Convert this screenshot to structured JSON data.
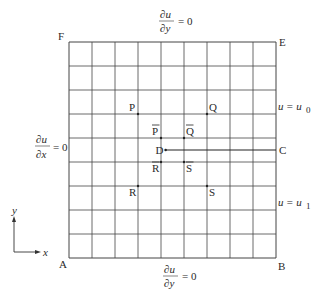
{
  "diagram": {
    "grid": {
      "columns": 9,
      "rows": 9
    },
    "corners": {
      "top_left": "F",
      "top_right": "E",
      "bottom_left": "A",
      "bottom_right": "B"
    },
    "boundary_labels": {
      "top": {
        "num": "∂u",
        "den": "∂y",
        "rhs": "= 0"
      },
      "bottom": {
        "num": "∂u",
        "den": "∂y",
        "rhs": "= 0"
      },
      "left": {
        "num": "∂u",
        "den": "∂x",
        "rhs": "= 0"
      },
      "right_upper": {
        "lhs": "u",
        "rhs": "= u",
        "sub": "0"
      },
      "right_lower": {
        "lhs": "u",
        "rhs": "= u",
        "sub": "1"
      }
    },
    "points": [
      {
        "id": "P",
        "label": "P",
        "bar": false,
        "col": 3,
        "row": 3
      },
      {
        "id": "Q",
        "label": "Q",
        "bar": false,
        "col": 6,
        "row": 3
      },
      {
        "id": "P-bar",
        "label": "P",
        "bar": true,
        "col": 4,
        "row": 4
      },
      {
        "id": "Q-bar",
        "label": "Q",
        "bar": true,
        "col": 5,
        "row": 4
      },
      {
        "id": "R-bar",
        "label": "R",
        "bar": true,
        "col": 4,
        "row": 5
      },
      {
        "id": "S-bar",
        "label": "S",
        "bar": true,
        "col": 5,
        "row": 5
      },
      {
        "id": "R",
        "label": "R",
        "bar": false,
        "col": 3,
        "row": 6
      },
      {
        "id": "S",
        "label": "S",
        "bar": false,
        "col": 6,
        "row": 6
      }
    ],
    "crack": {
      "start_label": "D",
      "end_label": "C",
      "start_col": 4.2,
      "row": 4.5
    },
    "axes": {
      "x_label": "x",
      "y_label": "y"
    }
  }
}
